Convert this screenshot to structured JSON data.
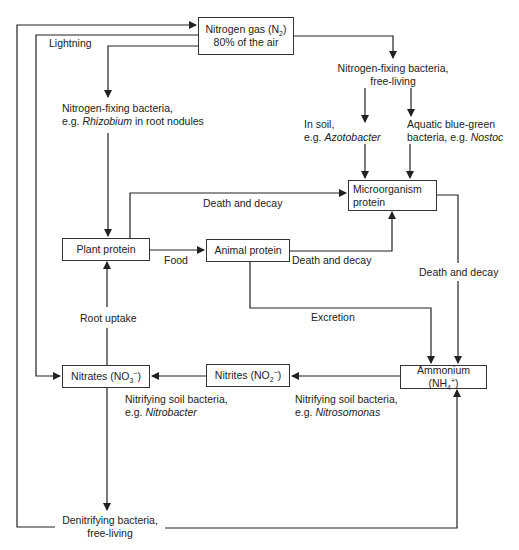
{
  "diagram": {
    "nodes": {
      "nitrogen_gas": {
        "line1": "Nitrogen gas (N",
        "sub": "2",
        "line1_end": ")",
        "line2": "80% of the air"
      },
      "microorganism_protein": {
        "line1": "Microorganism",
        "line2": "protein"
      },
      "plant_protein": {
        "label": "Plant protein"
      },
      "animal_protein": {
        "label": "Animal protein"
      },
      "nitrates": {
        "label": "Nitrates (NO",
        "sub": "3",
        "sup": "−",
        "end": ")"
      },
      "nitrites": {
        "label": "Nitrites (NO",
        "sub": "2",
        "sup": "−",
        "end": ")"
      },
      "ammonium": {
        "label": "Ammonium (NH",
        "sub": "4",
        "sup": "+",
        "end": ")"
      }
    },
    "labels": {
      "lightning": "Lightning",
      "rhizobium_line1": "Nitrogen-fixing bacteria,",
      "rhizobium_line2_prefix": "e.g. ",
      "rhizobium_line2_italic": "Rhizobium",
      "rhizobium_line2_suffix": " in root nodules",
      "free_living_line1": "Nitrogen-fixing bacteria,",
      "free_living_line2": "free-living",
      "soil_line1": "In soil,",
      "soil_line2_prefix": "e.g. ",
      "soil_line2_italic": "Azotobacter",
      "aquatic_line1": "Aquatic blue-green",
      "aquatic_line2_prefix": "bacteria, e.g. ",
      "aquatic_line2_italic": "Nostoc",
      "death_decay_plant": "Death and decay",
      "death_decay_animal": "Death and decay",
      "death_decay_micro": "Death and decay",
      "food": "Food",
      "excretion": "Excretion",
      "root_uptake": "Root uptake",
      "nitrobacter_line1": "Nitrifying soil bacteria,",
      "nitrobacter_line2_prefix": "e.g. ",
      "nitrobacter_line2_italic": "Nitrobacter",
      "nitrosomonas_line1": "Nitrifying soil bacteria,",
      "nitrosomonas_line2_prefix": "e.g. ",
      "nitrosomonas_line2_italic": "Nitrosomonas",
      "denitrifying_line1": "Denitrifying bacteria,",
      "denitrifying_line2": "free-living"
    },
    "colors": {
      "line": "#222222",
      "background": "#ffffff"
    }
  }
}
